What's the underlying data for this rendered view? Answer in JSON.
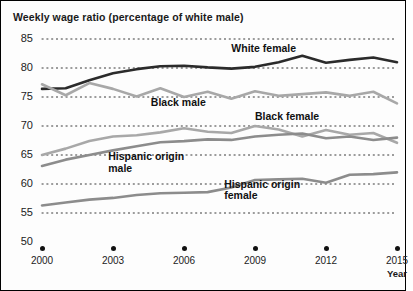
{
  "chart_data": {
    "type": "line",
    "title": "Weekly wage ratio (percentage of white male)",
    "xlabel": "Year",
    "ylabel": "",
    "xlim": [
      2000,
      2015
    ],
    "ylim": [
      50,
      85
    ],
    "y_ticks": [
      50,
      55,
      60,
      65,
      70,
      75,
      80,
      85
    ],
    "x_ticks": [
      2000,
      2003,
      2006,
      2009,
      2012,
      2015
    ],
    "x": [
      2000,
      2001,
      2002,
      2003,
      2004,
      2005,
      2006,
      2007,
      2008,
      2009,
      2010,
      2011,
      2012,
      2013,
      2014,
      2015
    ],
    "grid": "dotted-horizontal",
    "legend": "inline-labels",
    "series": [
      {
        "name": "White female",
        "color": "#2b2b2b",
        "values": [
          76.4,
          76.5,
          77.9,
          79.1,
          79.8,
          80.3,
          80.4,
          80.1,
          79.9,
          80.2,
          81.0,
          82.1,
          80.9,
          81.4,
          81.8,
          81.0
        ]
      },
      {
        "name": "Black male",
        "color": "#a8a8a8",
        "values": [
          77.2,
          75.3,
          77.4,
          76.4,
          75.1,
          76.5,
          75.0,
          75.9,
          74.7,
          76.0,
          75.2,
          75.5,
          75.8,
          75.2,
          75.9,
          73.9
        ]
      },
      {
        "name": "Black female",
        "color": "#a8a8a8",
        "values": [
          65.0,
          66.1,
          67.4,
          68.2,
          68.4,
          68.9,
          69.6,
          69.0,
          68.8,
          70.0,
          69.4,
          68.2,
          69.3,
          68.5,
          68.8,
          67.1
        ]
      },
      {
        "name": "Hispanic origin male",
        "color": "#8c8c8c",
        "values": [
          63.1,
          64.2,
          65.0,
          65.8,
          66.5,
          67.2,
          67.4,
          67.7,
          67.6,
          68.2,
          68.5,
          68.7,
          67.9,
          68.2,
          67.6,
          68.0
        ]
      },
      {
        "name": "Hispanic origin female",
        "color": "#8c8c8c",
        "values": [
          56.3,
          56.8,
          57.3,
          57.6,
          58.1,
          58.4,
          58.5,
          58.6,
          59.4,
          60.7,
          60.8,
          60.9,
          60.2,
          61.6,
          61.7,
          62.0
        ]
      }
    ],
    "annotations": [
      {
        "text": "White female",
        "x": 2008.0,
        "y": 83.2
      },
      {
        "text": "Black male",
        "x": 2004.6,
        "y": 73.9
      },
      {
        "text": "Black female",
        "x": 2009.0,
        "y": 71.6
      },
      {
        "text": "Hispanic origin\nmale",
        "x": 2002.8,
        "y": 64.6
      },
      {
        "text": "Hispanic origin\nfemale",
        "x": 2007.7,
        "y": 59.9
      }
    ]
  }
}
